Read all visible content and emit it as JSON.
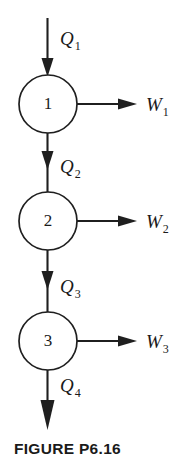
{
  "figure": {
    "caption": "FIGURE P6.16",
    "stroke_color": "#1f1f1f",
    "text_color": "#1a1a1a",
    "background_color": "#ffffff"
  },
  "nodes": [
    {
      "id": "node-1",
      "label": "1",
      "cx": 48,
      "cy": 104,
      "r": 29
    },
    {
      "id": "node-2",
      "label": "2",
      "cx": 48,
      "cy": 221,
      "r": 29
    },
    {
      "id": "node-3",
      "label": "3",
      "cx": 48,
      "cy": 341,
      "r": 29
    }
  ],
  "flows": [
    {
      "id": "flow-q1",
      "symbol": "Q",
      "subscript": "1",
      "direction": "down-into-node-1",
      "label_x": 60,
      "label_y": 45
    },
    {
      "id": "flow-q2",
      "symbol": "Q",
      "subscript": "2",
      "direction": "node-1-to-node-2",
      "label_x": 60,
      "label_y": 173
    },
    {
      "id": "flow-q3",
      "symbol": "Q",
      "subscript": "3",
      "direction": "node-2-to-node-3",
      "label_x": 60,
      "label_y": 293
    },
    {
      "id": "flow-q4",
      "symbol": "Q",
      "subscript": "4",
      "direction": "down-out-of-node-3",
      "label_x": 60,
      "label_y": 392
    },
    {
      "id": "flow-w1",
      "symbol": "W",
      "subscript": "1",
      "direction": "right-out-of-node-1",
      "label_x": 146,
      "label_y": 111
    },
    {
      "id": "flow-w2",
      "symbol": "W",
      "subscript": "2",
      "direction": "right-out-of-node-2",
      "label_x": 146,
      "label_y": 228
    },
    {
      "id": "flow-w3",
      "symbol": "W",
      "subscript": "3",
      "direction": "right-out-of-node-3",
      "label_x": 146,
      "label_y": 348
    }
  ]
}
